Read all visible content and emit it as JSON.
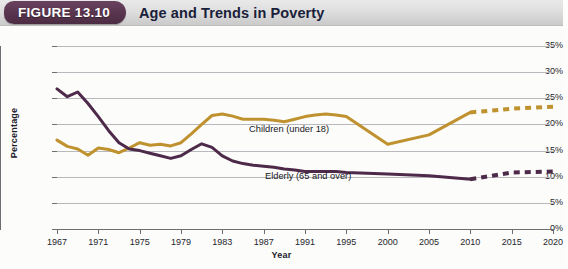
{
  "header": {
    "badge_label": "FIGURE 13.10",
    "title": "Age and Trends in Poverty",
    "badge_color": "#59354f",
    "band_color": "#dedede"
  },
  "chart_data": {
    "type": "line",
    "title": "Age and Trends in Poverty",
    "xlabel": "Year",
    "ylabel": "Percentage",
    "grid": true,
    "legend_position": "inline-annotation",
    "ylim": [
      0,
      35
    ],
    "ytick_labels": [
      "0%",
      "5%",
      "10%",
      "15%",
      "20%",
      "25%",
      "30%",
      "35%"
    ],
    "ytick_values": [
      0,
      5,
      10,
      15,
      20,
      25,
      30,
      35
    ],
    "xtick_labels": [
      "1967",
      "1971",
      "1975",
      "1979",
      "1983",
      "1987",
      "1991",
      "1995",
      "2000",
      "2005",
      "2010",
      "2015",
      "2020"
    ],
    "x": [
      1967,
      1968,
      1969,
      1970,
      1971,
      1972,
      1973,
      1974,
      1975,
      1976,
      1977,
      1978,
      1979,
      1980,
      1981,
      1982,
      1983,
      1984,
      1985,
      1986,
      1987,
      1988,
      1989,
      1990,
      1991,
      1992,
      1993,
      1994,
      1995,
      2000,
      2005,
      2010,
      2015,
      2020
    ],
    "series": [
      {
        "name": "Children (under 18)",
        "color": "#bf922f",
        "label": "Children (under 18)",
        "solid_through": 2010,
        "dashed_from": 2010,
        "values": [
          17.0,
          15.8,
          15.3,
          14.1,
          15.5,
          15.2,
          14.6,
          15.5,
          16.5,
          16.0,
          16.2,
          15.9,
          16.5,
          18.2,
          20.0,
          21.7,
          22.0,
          21.6,
          21.0,
          21.0,
          21.0,
          20.8,
          20.5,
          21.0,
          21.5,
          21.8,
          22.0,
          21.8,
          21.5,
          16.2,
          18.0,
          22.3,
          23.0,
          23.4
        ]
      },
      {
        "name": "Elderly (65 and over)",
        "color": "#4e2a4a",
        "label": "Elderly (65 and over)",
        "solid_through": 2010,
        "dashed_from": 2010,
        "values": [
          26.8,
          25.3,
          26.2,
          24.0,
          21.5,
          18.8,
          16.5,
          15.3,
          15.0,
          14.5,
          14.0,
          13.5,
          14.0,
          15.2,
          16.3,
          15.6,
          14.0,
          13.0,
          12.5,
          12.2,
          12.0,
          11.8,
          11.5,
          11.3,
          11.0,
          11.0,
          11.0,
          11.0,
          10.8,
          10.5,
          10.2,
          9.5,
          10.8,
          11.0
        ]
      }
    ]
  }
}
